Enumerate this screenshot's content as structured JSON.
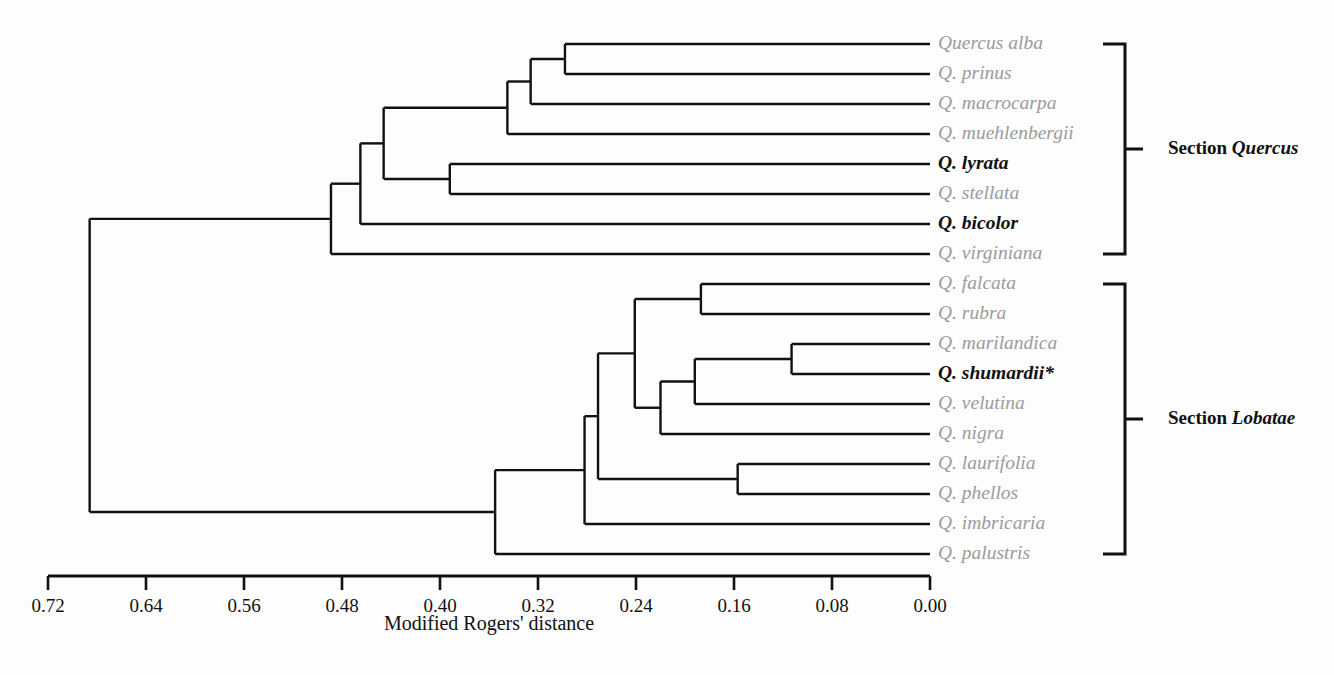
{
  "figure": {
    "type": "dendrogram",
    "background_color": "#fdfdfd",
    "line_color": "#111111",
    "label_color": "#9b9b9b",
    "highlight_color": "#111111"
  },
  "chart_data": {
    "type": "dendrogram",
    "title": "",
    "xlabel": "Modified Rogers' distance",
    "ylabel": "",
    "xlim": [
      0.72,
      0.0
    ],
    "axis_reversed": true,
    "grid": false,
    "legend_position": "none",
    "tick_labels": [
      "0.72",
      "0.64",
      "0.56",
      "0.48",
      "0.40",
      "0.32",
      "0.24",
      "0.16",
      "0.08",
      "0.00"
    ],
    "tick_values": [
      0.72,
      0.64,
      0.56,
      0.48,
      0.4,
      0.32,
      0.24,
      0.16,
      0.08,
      0.0
    ],
    "leaves": [
      {
        "label": "Quercus alba",
        "highlight": false
      },
      {
        "label": "Q. prinus",
        "highlight": false
      },
      {
        "label": "Q. macrocarpa",
        "highlight": false
      },
      {
        "label": "Q. muehlenbergii",
        "highlight": false
      },
      {
        "label": "Q. lyrata",
        "highlight": true
      },
      {
        "label": "Q. stellata",
        "highlight": false
      },
      {
        "label": "Q. bicolor",
        "highlight": true
      },
      {
        "label": "Q. virginiana",
        "highlight": false
      },
      {
        "label": "Q. falcata",
        "highlight": false
      },
      {
        "label": "Q. rubra",
        "highlight": false
      },
      {
        "label": "Q. marilandica",
        "highlight": false
      },
      {
        "label": "Q. shumardii*",
        "highlight": true
      },
      {
        "label": "Q. velutina",
        "highlight": false
      },
      {
        "label": "Q. nigra",
        "highlight": false
      },
      {
        "label": "Q. laurifolia",
        "highlight": false
      },
      {
        "label": "Q. phellos",
        "highlight": false
      },
      {
        "label": "Q. imbricaria",
        "highlight": false
      },
      {
        "label": "Q. palustris",
        "highlight": false
      }
    ],
    "nodes": [
      {
        "id": "n_alba_prinus",
        "children": [
          "Quercus alba",
          "Q. prinus"
        ],
        "distance": 0.298
      },
      {
        "id": "n_macrocarpa",
        "children": [
          "n_alba_prinus",
          "Q. macrocarpa"
        ],
        "distance": 0.326
      },
      {
        "id": "n_muehlenbergii",
        "children": [
          "n_macrocarpa",
          "Q. muehlenbergii"
        ],
        "distance": 0.345
      },
      {
        "id": "n_lyrata_stellata",
        "children": [
          "Q. lyrata",
          "Q. stellata"
        ],
        "distance": 0.392
      },
      {
        "id": "n_white_core",
        "children": [
          "n_muehlenbergii",
          "n_lyrata_stellata"
        ],
        "distance": 0.446
      },
      {
        "id": "n_bicolor",
        "children": [
          "n_white_core",
          "Q. bicolor"
        ],
        "distance": 0.465
      },
      {
        "id": "n_quercus_section",
        "children": [
          "n_bicolor",
          "Q. virginiana"
        ],
        "distance": 0.489
      },
      {
        "id": "n_falcata_rubra",
        "children": [
          "Q. falcata",
          "Q. rubra"
        ],
        "distance": 0.187
      },
      {
        "id": "n_maril_shum",
        "children": [
          "Q. marilandica",
          "Q. shumardii*"
        ],
        "distance": 0.113
      },
      {
        "id": "n_velutina",
        "children": [
          "n_maril_shum",
          "Q. velutina"
        ],
        "distance": 0.192
      },
      {
        "id": "n_nigra",
        "children": [
          "n_velutina",
          "Q. nigra"
        ],
        "distance": 0.22
      },
      {
        "id": "n_red_core",
        "children": [
          "n_falcata_rubra",
          "n_nigra"
        ],
        "distance": 0.241
      },
      {
        "id": "n_lauri_phellos",
        "children": [
          "Q. laurifolia",
          "Q. phellos"
        ],
        "distance": 0.157
      },
      {
        "id": "n_imbricaria",
        "children": [
          "n_red_core",
          "n_lauri_phellos"
        ],
        "distance": 0.271
      },
      {
        "id": "n_lobatae_section",
        "children": [
          "n_imbricaria",
          "Q. imbricaria"
        ],
        "distance": 0.282
      },
      {
        "id": "n_palustris",
        "children": [
          "n_lobatae_section",
          "Q. palustris"
        ],
        "distance": 0.355
      },
      {
        "id": "n_root",
        "children": [
          "n_quercus_section",
          "n_palustris"
        ],
        "distance": 0.686
      }
    ],
    "sections": [
      {
        "id": "section-quercus",
        "prefix": "Section ",
        "taxon": "Quercus",
        "first_leaf": "Quercus alba",
        "last_leaf": "Q. virginiana"
      },
      {
        "id": "section-lobatae",
        "prefix": "Section ",
        "taxon": "Lobatae",
        "first_leaf": "Q. falcata",
        "last_leaf": "Q. palustris"
      }
    ]
  },
  "geometry": {
    "x_at_zero": 930,
    "pixels_per_unit": 1225,
    "first_leaf_y": 44,
    "leaf_spacing": 30,
    "gap_between_sections": 0,
    "label_x": 938,
    "bracket_x": 1125,
    "bracket_arm": 22,
    "section_label_x": 1168,
    "axis_y": 576,
    "axis_tick_length": 14,
    "axis_title_y": 630
  }
}
